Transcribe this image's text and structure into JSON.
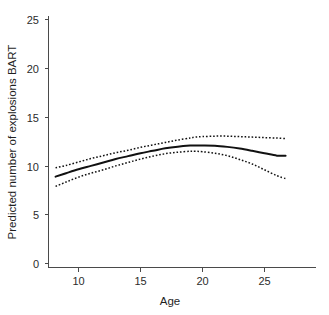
{
  "chart_data": {
    "type": "line",
    "title": "",
    "subtitle": "",
    "xlabel": "Age",
    "ylabel": "Predicted number of explosions BART",
    "xlim": [
      7.2,
      27.8
    ],
    "ylim": [
      0,
      26.5
    ],
    "xticks": [
      10,
      15,
      20,
      25
    ],
    "xtick_labels": [
      "10",
      "15",
      "20",
      "25"
    ],
    "yticks": [
      0,
      5,
      10,
      15,
      20,
      25
    ],
    "ytick_labels": [
      "0",
      "5",
      "10",
      "15",
      "20",
      "25"
    ],
    "grid": false,
    "legend": false,
    "legend_position": "none",
    "x": [
      8.15,
      9.0,
      10.0,
      11.0,
      12.0,
      13.0,
      14.0,
      15.0,
      16.0,
      17.0,
      18.0,
      19.0,
      19.4,
      20.0,
      21.0,
      22.0,
      23.0,
      24.0,
      25.0,
      26.0,
      26.7
    ],
    "series": [
      {
        "name": "Predicted value (fitted curve)",
        "style": "solid",
        "color": "#111111",
        "values": [
          8.9,
          9.25,
          9.65,
          10.0,
          10.35,
          10.7,
          11.0,
          11.3,
          11.55,
          11.8,
          11.97,
          12.08,
          12.1,
          12.1,
          12.07,
          11.95,
          11.78,
          11.55,
          11.3,
          11.05,
          11.05
        ]
      },
      {
        "name": "Upper 95% confidence band",
        "style": "dotted",
        "color": "#111111",
        "values": [
          9.8,
          10.05,
          10.4,
          10.75,
          11.05,
          11.35,
          11.6,
          11.9,
          12.15,
          12.4,
          12.65,
          12.85,
          12.95,
          13.0,
          13.05,
          13.05,
          13.0,
          12.95,
          12.9,
          12.85,
          12.8
        ]
      },
      {
        "name": "Lower 95% confidence band",
        "style": "dotted",
        "color": "#111111",
        "values": [
          7.9,
          8.35,
          8.85,
          9.25,
          9.6,
          10.0,
          10.35,
          10.7,
          11.0,
          11.25,
          11.4,
          11.5,
          11.5,
          11.45,
          11.3,
          11.05,
          10.65,
          10.2,
          9.6,
          9.0,
          8.7
        ]
      }
    ],
    "annotations": []
  },
  "figure": {
    "background_color": "#ffffff",
    "line_color": "#111111",
    "axis_color": "#4a4a4a"
  }
}
